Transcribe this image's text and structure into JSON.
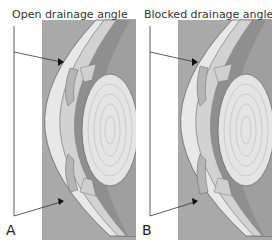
{
  "panels": [
    {
      "id": "A",
      "title": "Open drainage angle",
      "letter": "A"
    },
    {
      "id": "B",
      "title": "Blocked drainage angle",
      "letter": "B"
    }
  ],
  "colors": {
    "sclera": "#f2f2f2",
    "cornea_band": "#d9d9d9",
    "uvea": "#8c8c8c",
    "iris": "#9e9e9e",
    "background_dark": "#a6a6a6",
    "lens": "#e6e6e6",
    "outline": "#555555"
  }
}
